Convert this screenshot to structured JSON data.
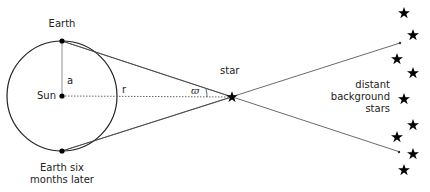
{
  "diagram": {
    "labels": {
      "earth_top": "Earth",
      "earth_bottom_line1": "Earth six",
      "earth_bottom_line2": "months later",
      "sun": "Sun",
      "radius": "a",
      "distance": "r",
      "angle": "ϖ",
      "star": "star",
      "background_line1": "distant",
      "background_line2": "background",
      "background_line3": "stars"
    },
    "geometry": {
      "sun": [
        62,
        96
      ],
      "orbit_radius": 55,
      "earth_top": [
        62,
        41
      ],
      "earth_bottom": [
        62,
        151
      ],
      "star": [
        232,
        97
      ],
      "upper_line_end": [
        400,
        43
      ],
      "lower_line_end": [
        399,
        152
      ],
      "background_stars": [
        [
          404,
          13
        ],
        [
          413,
          35
        ],
        [
          397,
          59
        ],
        [
          413,
          73
        ],
        [
          404,
          99
        ],
        [
          413,
          125
        ],
        [
          397,
          137
        ],
        [
          413,
          154
        ],
        [
          404,
          170
        ]
      ]
    },
    "colors": {
      "line": "#333333",
      "text": "#222222",
      "dot": "#000000"
    }
  }
}
